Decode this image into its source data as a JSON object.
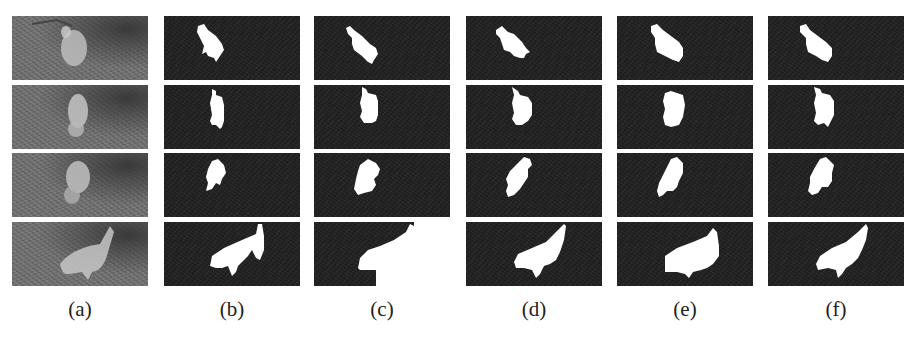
{
  "figure": {
    "rows": 4,
    "columns": [
      {
        "id": "a",
        "label": "(a)",
        "kind": "input-frame"
      },
      {
        "id": "b",
        "label": "(b)",
        "kind": "mask"
      },
      {
        "id": "c",
        "label": "(c)",
        "kind": "mask"
      },
      {
        "id": "d",
        "label": "(d)",
        "kind": "mask"
      },
      {
        "id": "e",
        "label": "(e)",
        "kind": "mask"
      },
      {
        "id": "f",
        "label": "(f)",
        "kind": "mask"
      }
    ],
    "colors": {
      "mask_background": "#1f1f1f",
      "mask_foreground": "#ffffff",
      "photo_tone": "#6e6e6e",
      "label_text": "#222222"
    }
  }
}
